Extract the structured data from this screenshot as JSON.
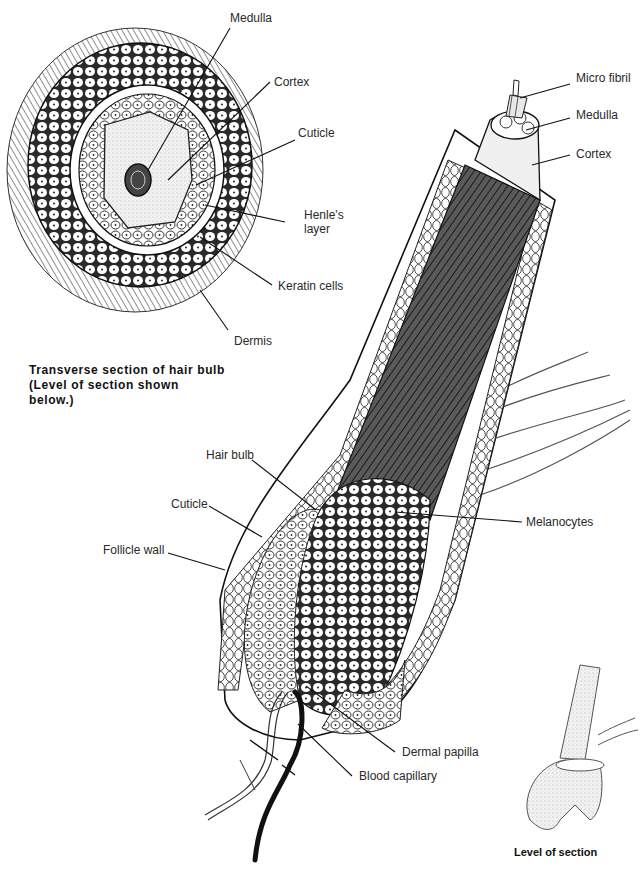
{
  "transverse_section": {
    "caption": "Transverse section of hair bulb\n(Level of section shown\nbelow.)",
    "labels": {
      "medulla": "Medulla",
      "cortex": "Cortex",
      "cuticle": "Cuticle",
      "henles_layer_1": "Henle's",
      "henles_layer_2": "layer",
      "keratin_cells": "Keratin cells",
      "dermis": "Dermis"
    }
  },
  "follicle": {
    "labels": {
      "micro_fibril": "Micro fibril",
      "medulla": "Medulla",
      "cortex": "Cortex",
      "hair_bulb": "Hair bulb",
      "cuticle": "Cuticle",
      "follicle_wall": "Follicle wall",
      "melanocytes": "Melanocytes",
      "dermal_papilla": "Dermal papilla",
      "blood_capillary": "Blood capillary"
    }
  },
  "inset": {
    "caption": "Level of section"
  },
  "colors": {
    "ink": "#1a1a1a",
    "label_text": "#2a2a2a",
    "shade_dark": "#3a3a3a",
    "shade_mid": "#8a8a8a",
    "stipple": "#d8d8d8",
    "background": "#ffffff"
  }
}
